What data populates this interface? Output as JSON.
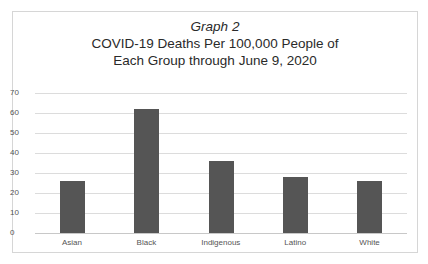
{
  "chart_data": {
    "type": "bar",
    "title_italic": "Graph 2",
    "title": "COVID-19 Deaths Per 100,000 People of Each Group through June 9, 2020",
    "title_lines": [
      "COVID-19 Deaths Per 100,000 People of",
      "Each Group through June 9, 2020"
    ],
    "categories": [
      "Asian",
      "Black",
      "Indigenous",
      "Latino",
      "White"
    ],
    "values": [
      26,
      62,
      36,
      28,
      26
    ],
    "xlabel": "",
    "ylabel": "",
    "ylim": [
      0,
      70
    ],
    "yticks": [
      "0",
      "10",
      "20",
      "30",
      "40",
      "50",
      "60",
      "70"
    ],
    "grid": true,
    "legend": "none",
    "bar_color": "#555555"
  }
}
